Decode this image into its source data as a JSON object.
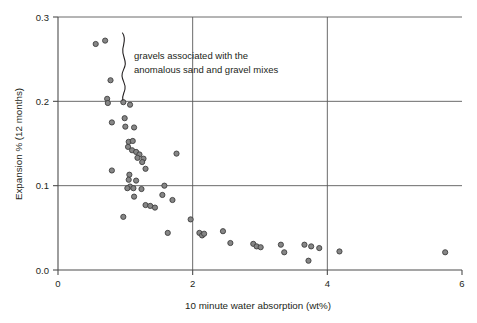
{
  "chart_data": {
    "type": "scatter",
    "title": "",
    "xlabel": "10 minute water absorption (wt%)",
    "ylabel": "Expansion % (12 months)",
    "xlim": [
      0,
      6
    ],
    "ylim": [
      0.0,
      0.3
    ],
    "xticks": [
      0,
      2,
      4,
      6
    ],
    "xtick_labels": [
      "0",
      "2",
      "4",
      "6"
    ],
    "yticks": [
      0.0,
      0.1,
      0.2,
      0.3
    ],
    "ytick_labels": [
      "0.0",
      "0.1",
      "0.2",
      "0.3"
    ],
    "grid": true,
    "grid_x": [
      2,
      4
    ],
    "grid_y": [
      0.1,
      0.2,
      0.3
    ],
    "legend": "none",
    "marker": {
      "shape": "circle",
      "fill": "#868686",
      "edge": "#3f3f3f",
      "size": 5.2
    },
    "annotations": [
      {
        "name": "gravels-annotation",
        "lines": [
          "gravels associated with the",
          "anomalous sand and gravel mixes"
        ],
        "brace": true,
        "brace_x": 1.0,
        "brace_y_range": [
          0.2,
          0.295
        ],
        "text_x": 1.18,
        "text_y": 0.255
      }
    ],
    "points": [
      {
        "x": 0.56,
        "y": 0.268
      },
      {
        "x": 0.7,
        "y": 0.272
      },
      {
        "x": 0.78,
        "y": 0.225
      },
      {
        "x": 0.73,
        "y": 0.203
      },
      {
        "x": 0.74,
        "y": 0.198
      },
      {
        "x": 0.97,
        "y": 0.199
      },
      {
        "x": 1.07,
        "y": 0.196
      },
      {
        "x": 0.8,
        "y": 0.175
      },
      {
        "x": 0.99,
        "y": 0.18
      },
      {
        "x": 1.0,
        "y": 0.17
      },
      {
        "x": 1.13,
        "y": 0.169
      },
      {
        "x": 1.05,
        "y": 0.152
      },
      {
        "x": 1.11,
        "y": 0.153
      },
      {
        "x": 1.04,
        "y": 0.146
      },
      {
        "x": 1.1,
        "y": 0.142
      },
      {
        "x": 1.16,
        "y": 0.14
      },
      {
        "x": 1.21,
        "y": 0.137
      },
      {
        "x": 1.18,
        "y": 0.133
      },
      {
        "x": 1.27,
        "y": 0.132
      },
      {
        "x": 1.25,
        "y": 0.128
      },
      {
        "x": 1.76,
        "y": 0.138
      },
      {
        "x": 1.3,
        "y": 0.12
      },
      {
        "x": 0.8,
        "y": 0.118
      },
      {
        "x": 1.06,
        "y": 0.113
      },
      {
        "x": 1.05,
        "y": 0.107
      },
      {
        "x": 1.16,
        "y": 0.106
      },
      {
        "x": 1.07,
        "y": 0.099
      },
      {
        "x": 1.03,
        "y": 0.097
      },
      {
        "x": 1.12,
        "y": 0.097
      },
      {
        "x": 1.24,
        "y": 0.096
      },
      {
        "x": 1.58,
        "y": 0.1
      },
      {
        "x": 1.13,
        "y": 0.087
      },
      {
        "x": 1.55,
        "y": 0.089
      },
      {
        "x": 1.7,
        "y": 0.083
      },
      {
        "x": 1.3,
        "y": 0.077
      },
      {
        "x": 1.37,
        "y": 0.076
      },
      {
        "x": 1.44,
        "y": 0.074
      },
      {
        "x": 0.97,
        "y": 0.063
      },
      {
        "x": 1.97,
        "y": 0.06
      },
      {
        "x": 1.63,
        "y": 0.044
      },
      {
        "x": 2.1,
        "y": 0.044
      },
      {
        "x": 2.14,
        "y": 0.041
      },
      {
        "x": 2.17,
        "y": 0.043
      },
      {
        "x": 2.45,
        "y": 0.046
      },
      {
        "x": 2.56,
        "y": 0.032
      },
      {
        "x": 2.9,
        "y": 0.031
      },
      {
        "x": 2.95,
        "y": 0.028
      },
      {
        "x": 3.01,
        "y": 0.027
      },
      {
        "x": 3.31,
        "y": 0.03
      },
      {
        "x": 3.36,
        "y": 0.021
      },
      {
        "x": 3.66,
        "y": 0.03
      },
      {
        "x": 3.76,
        "y": 0.028
      },
      {
        "x": 3.88,
        "y": 0.026
      },
      {
        "x": 3.72,
        "y": 0.011
      },
      {
        "x": 4.18,
        "y": 0.022
      },
      {
        "x": 5.75,
        "y": 0.021
      }
    ]
  },
  "labels": {
    "xlabel": "10 minute water absorption (wt%)",
    "ylabel": "Expansion % (12 months)",
    "annotation_line1": "gravels associated with the",
    "annotation_line2": "anomalous sand and gravel mixes"
  }
}
